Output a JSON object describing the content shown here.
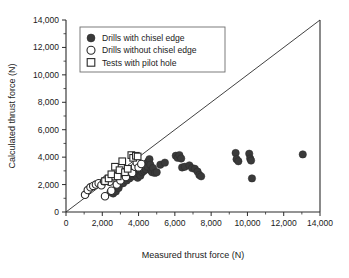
{
  "chart_data": {
    "type": "scatter",
    "title": "",
    "xlabel": "Measured thrust force (N)",
    "ylabel": "Calculated thrust force  (N)",
    "xlim": [
      0,
      14000
    ],
    "ylim": [
      0,
      14000
    ],
    "xticks": [
      0,
      2000,
      4000,
      6000,
      8000,
      10000,
      12000,
      14000
    ],
    "yticks": [
      0,
      2000,
      4000,
      6000,
      8000,
      10000,
      12000,
      14000
    ],
    "xtick_labels": [
      "0",
      "2,000",
      "4,000",
      "6,000",
      "8,000",
      "10,000",
      "12,000",
      "14,000"
    ],
    "ytick_labels": [
      "0",
      "2,000",
      "4,000",
      "6,000",
      "8,000",
      "10,000",
      "12,000",
      "14,000"
    ],
    "minor_ticks": true,
    "grid": false,
    "legend_position": "top-left",
    "reference_line": {
      "name": "one-to-one-line",
      "from": [
        0,
        0
      ],
      "to": [
        14000,
        14000
      ]
    },
    "series": [
      {
        "name": "Drills with chisel edge",
        "marker": "filled-circle",
        "color": "#3a3a3a",
        "points": [
          [
            2450,
            1450
          ],
          [
            2600,
            1350
          ],
          [
            2750,
            1500
          ],
          [
            2900,
            1750
          ],
          [
            3000,
            2050
          ],
          [
            3050,
            2250
          ],
          [
            3150,
            2100
          ],
          [
            3250,
            2400
          ],
          [
            3350,
            2300
          ],
          [
            3400,
            2550
          ],
          [
            3500,
            2450
          ],
          [
            3600,
            2700
          ],
          [
            3700,
            2600
          ],
          [
            3750,
            2850
          ],
          [
            3850,
            2750
          ],
          [
            3900,
            2950
          ],
          [
            3950,
            2500
          ],
          [
            4000,
            2800
          ],
          [
            4050,
            3050
          ],
          [
            4100,
            2650
          ],
          [
            4150,
            3150
          ],
          [
            4200,
            2900
          ],
          [
            4250,
            3250
          ],
          [
            4300,
            3000
          ],
          [
            4350,
            3400
          ],
          [
            4400,
            3100
          ],
          [
            4450,
            3550
          ],
          [
            4500,
            3300
          ],
          [
            4550,
            3700
          ],
          [
            4600,
            3850
          ],
          [
            4650,
            3450
          ],
          [
            4700,
            3000
          ],
          [
            4750,
            2900
          ],
          [
            4800,
            3200
          ],
          [
            4900,
            2850
          ],
          [
            5000,
            2900
          ],
          [
            5200,
            3450
          ],
          [
            5450,
            3600
          ],
          [
            6050,
            4100
          ],
          [
            6150,
            3950
          ],
          [
            6250,
            4150
          ],
          [
            6350,
            3900
          ],
          [
            6400,
            3250
          ],
          [
            6550,
            3300
          ],
          [
            6800,
            3400
          ],
          [
            6950,
            3200
          ],
          [
            7100,
            3150
          ],
          [
            7250,
            2950
          ],
          [
            7350,
            2700
          ],
          [
            7450,
            2600
          ],
          [
            9350,
            4300
          ],
          [
            9400,
            3850
          ],
          [
            9500,
            3700
          ],
          [
            10100,
            4250
          ],
          [
            10150,
            3900
          ],
          [
            10200,
            3750
          ],
          [
            10250,
            2450
          ],
          [
            13050,
            4200
          ]
        ]
      },
      {
        "name": "Drills without chisel edge",
        "marker": "open-circle",
        "color": "#ffffff",
        "points": [
          [
            1050,
            1250
          ],
          [
            1200,
            1600
          ],
          [
            1350,
            1800
          ],
          [
            1500,
            1900
          ],
          [
            1650,
            2000
          ],
          [
            1800,
            2100
          ],
          [
            1950,
            1950
          ],
          [
            2100,
            2250
          ],
          [
            2150,
            1150
          ],
          [
            2250,
            2400
          ],
          [
            2400,
            2200
          ],
          [
            2500,
            1550
          ],
          [
            2650,
            2600
          ],
          [
            2800,
            2000
          ],
          [
            2900,
            2750
          ],
          [
            3000,
            2300
          ],
          [
            3150,
            2900
          ],
          [
            3300,
            2550
          ],
          [
            3500,
            3100
          ],
          [
            3650,
            2850
          ],
          [
            3800,
            3300
          ],
          [
            3900,
            3600
          ],
          [
            4000,
            3250
          ],
          [
            4150,
            3500
          ]
        ]
      },
      {
        "name": "Tests with pilot hole",
        "marker": "open-square",
        "color": "#ffffff",
        "points": [
          [
            2150,
            2250
          ],
          [
            2350,
            2450
          ],
          [
            2500,
            2750
          ],
          [
            2700,
            3300
          ],
          [
            2850,
            2600
          ],
          [
            2950,
            3050
          ],
          [
            3100,
            3700
          ],
          [
            3250,
            2900
          ],
          [
            3400,
            3150
          ],
          [
            3600,
            4150
          ],
          [
            3700,
            3950
          ],
          [
            3850,
            4100
          ],
          [
            3950,
            4050
          ]
        ]
      }
    ]
  },
  "legend": {
    "items": [
      {
        "label": "Drills with chisel edge",
        "marker": "filled-circle"
      },
      {
        "label": "Drills without chisel edge",
        "marker": "open-circle"
      },
      {
        "label": "Tests with pilot hole",
        "marker": "open-square"
      }
    ]
  }
}
